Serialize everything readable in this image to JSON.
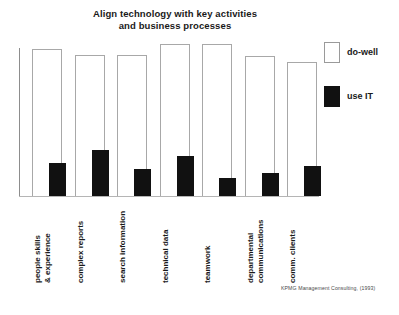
{
  "chart_data": {
    "type": "bar",
    "title": "Align technology with key activities and business processes",
    "title_line1": "Align technology with key activities",
    "title_line2": "and business processes",
    "xlabel": "",
    "ylabel": "",
    "ylim": [
      0,
      100
    ],
    "grid": false,
    "legend_position": "right",
    "categories": [
      "people skills & experience",
      "complex reports",
      "search information",
      "technical data",
      "teamwork",
      "departmental communications",
      "comm. clients"
    ],
    "category_lines": [
      {
        "line1": "people skills",
        "line2": "& experience"
      },
      {
        "line1": "complex reports",
        "line2": ""
      },
      {
        "line1": "search information",
        "line2": ""
      },
      {
        "line1": "technical data",
        "line2": ""
      },
      {
        "line1": "teamwork",
        "line2": ""
      },
      {
        "line1": "departmental",
        "line2": "communications"
      },
      {
        "line1": "comm. clients",
        "line2": ""
      }
    ],
    "series": [
      {
        "name": "do-well",
        "color": "#ffffff",
        "values": [
          97,
          93,
          93,
          100,
          100,
          92,
          88
        ]
      },
      {
        "name": "use IT",
        "color": "#111111",
        "values": [
          22,
          30,
          18,
          26,
          12,
          15,
          20
        ]
      }
    ]
  },
  "legend": {
    "items": [
      {
        "label": "do-well",
        "swatch": "open"
      },
      {
        "label": "use IT",
        "swatch": "filled"
      }
    ]
  },
  "source": {
    "note": "KPMG Management Consulting, (1993)"
  }
}
